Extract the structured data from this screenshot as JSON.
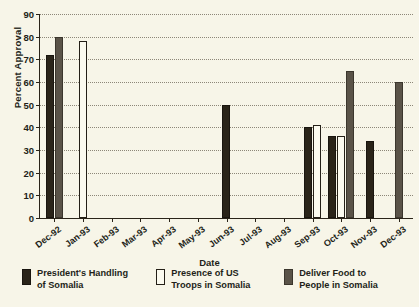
{
  "chart_data": {
    "type": "bar",
    "title": "",
    "xlabel": "Date",
    "ylabel": "Percent Approval",
    "ylim": [
      0,
      90
    ],
    "ytick_step": 10,
    "yticks": [
      0,
      10,
      20,
      30,
      40,
      50,
      60,
      70,
      80,
      90
    ],
    "grid": true,
    "legend_position": "bottom",
    "categories": [
      "Dec-92",
      "Jan-93",
      "Feb-93",
      "Mar-93",
      "Apr-93",
      "May-93",
      "Jun-93",
      "Jul-93",
      "Aug-93",
      "Sep-93",
      "Oct-93",
      "Nov-93",
      "Dec-93"
    ],
    "series": [
      {
        "name": "President's Handling of Somalia",
        "color": "#2a2419",
        "values": [
          72,
          null,
          null,
          null,
          null,
          null,
          50,
          null,
          null,
          40,
          36,
          34,
          null
        ]
      },
      {
        "name": "Presence of US Troops in Somalia",
        "color": "#fbfaef",
        "values": [
          null,
          78,
          null,
          null,
          null,
          null,
          null,
          null,
          null,
          41,
          36,
          null,
          null
        ]
      },
      {
        "name": "Deliver Food to People in Somalia",
        "color": "#5a5348",
        "values": [
          80,
          null,
          null,
          null,
          null,
          null,
          null,
          null,
          null,
          null,
          65,
          null,
          60
        ]
      }
    ]
  },
  "legend": {
    "items": [
      {
        "label_line1": "President's Handling",
        "label_line2": "of Somalia"
      },
      {
        "label_line1": "Presence of US",
        "label_line2": "Troops in Somalia"
      },
      {
        "label_line1": "Deliver Food to",
        "label_line2": "People in Somalia"
      }
    ]
  },
  "colors": {
    "background": "#f7f5e8",
    "axis": "#2a2419",
    "grid": "#8d8778",
    "series_black": "#2a2419",
    "series_white": "#fbfaef",
    "series_gray": "#5a5348"
  }
}
